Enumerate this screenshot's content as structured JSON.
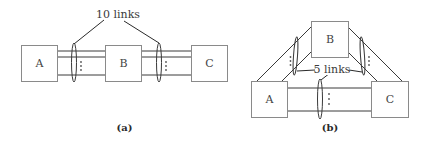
{
  "diagram_a": {
    "caption": "(a)",
    "nodes": [
      {
        "id": "A",
        "label": "A"
      },
      {
        "id": "B",
        "label": "B"
      },
      {
        "id": "C",
        "label": "C"
      }
    ],
    "edges": [
      {
        "from": "A",
        "to": "B"
      },
      {
        "from": "B",
        "to": "C"
      }
    ],
    "annotation": "10 links"
  },
  "diagram_b": {
    "caption": "(b)",
    "nodes": [
      {
        "id": "A",
        "label": "A"
      },
      {
        "id": "B",
        "label": "B"
      },
      {
        "id": "C",
        "label": "C"
      }
    ],
    "edges": [
      {
        "from": "A",
        "to": "B"
      },
      {
        "from": "B",
        "to": "C"
      },
      {
        "from": "A",
        "to": "C"
      }
    ],
    "annotation": "5 links"
  },
  "colors": {
    "box_stroke": "#8a8a8a",
    "line": "#3a3a3a",
    "text": "#3a3a3a"
  }
}
